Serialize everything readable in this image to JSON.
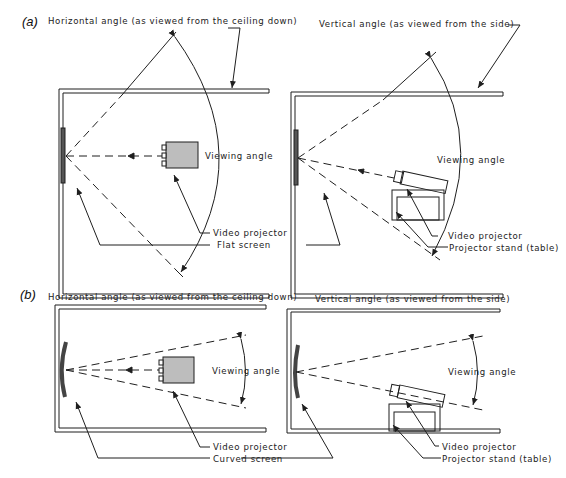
{
  "figure": {
    "panels": [
      {
        "tag": "(a)",
        "left": {
          "title": "Horizontal angle (as viewed from the ceiling down)",
          "viewing_angle": "Viewing angle",
          "callout_1": "Video projector",
          "callout_2": "Flat screen"
        },
        "right": {
          "title": "Vertical angle (as viewed from the side)",
          "viewing_angle": "Viewing angle",
          "callout_1": "Video projector",
          "callout_2": "Projector stand (table)"
        }
      },
      {
        "tag": "(b)",
        "left": {
          "title": "Horizontal angle (as viewed from the ceiling down)",
          "viewing_angle": "Viewing angle",
          "callout_1": "Video projector",
          "callout_2": "Curved screen"
        },
        "right": {
          "title": "Vertical angle (as viewed from the side)",
          "viewing_angle": "Viewing angle",
          "callout_1": "Video projector",
          "callout_2": "Projector stand (table)"
        }
      }
    ],
    "colors": {
      "line": "#1f1f1f",
      "screen_fill": "#555555",
      "projector_fill": "#bdbdbd"
    }
  }
}
